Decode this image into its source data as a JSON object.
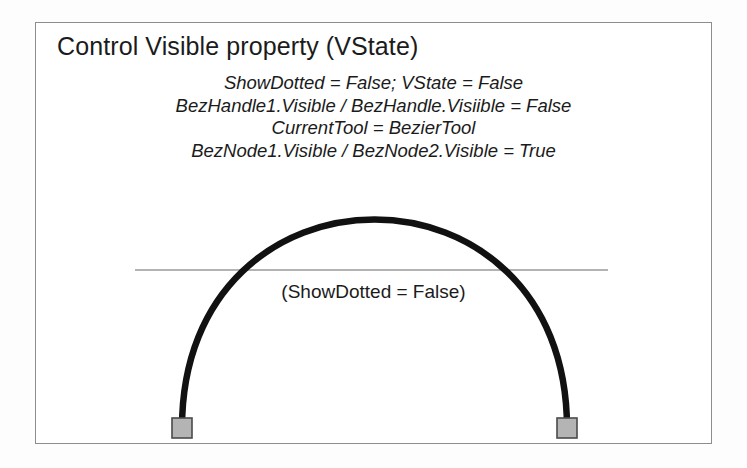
{
  "figure": {
    "title": "Control Visible property (VState)",
    "property_lines": [
      "ShowDotted = False; VState = False",
      "BezHandle1.Visible / BezHandle.Visiible = False",
      "CurrentTool = BezierTool",
      "BezNode1.Visible / BezNode2.Visible = True"
    ],
    "shape_caption": "(ShowDotted = False)",
    "colors": {
      "frame_border": "#8d8d91",
      "curve_stroke": "#111111",
      "baseline_stroke": "#9a9a9e",
      "node_fill": "#b4b4b4",
      "node_border": "#4a4a4a",
      "text": "#1b1b1b",
      "page_background": "#ffffff"
    },
    "curve": {
      "type": "bezier-arc",
      "start_point": [
        182,
        428
      ],
      "end_point": [
        567,
        428
      ],
      "control_point_1": [
        182,
        150
      ],
      "control_point_2": [
        567,
        150
      ],
      "stroke_width": 6
    },
    "baseline": {
      "x_start": 135,
      "x_end": 608,
      "y": 270
    },
    "nodes": [
      {
        "name": "BezNode1",
        "x": 172,
        "y": 418,
        "size": 20,
        "visible": true
      },
      {
        "name": "BezNode2",
        "x": 557,
        "y": 418,
        "size": 20,
        "visible": true
      }
    ]
  }
}
